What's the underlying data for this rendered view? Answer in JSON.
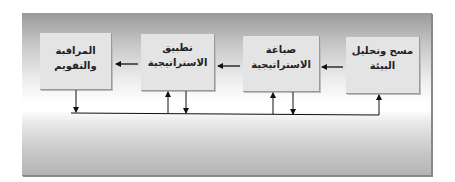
{
  "diagram": {
    "type": "flow",
    "direction": "right-to-left",
    "boxes": [
      {
        "id": "survey",
        "line1": "مسح وتحليل",
        "line2": "البيئة"
      },
      {
        "id": "formulation",
        "line1": "صياغة",
        "line2": "الاستراتيجية"
      },
      {
        "id": "implementation",
        "line1": "تطبيق",
        "line2": "الاستراتيجية"
      },
      {
        "id": "monitoring",
        "line1": "المراقبة والتقويم",
        "line2": ""
      }
    ],
    "edges": [
      {
        "from": "survey",
        "to": "formulation"
      },
      {
        "from": "formulation",
        "to": "implementation"
      },
      {
        "from": "implementation",
        "to": "monitoring"
      }
    ],
    "feedback": {
      "description": "Monitoring feeds a common feedback line that returns to all previous stages",
      "down_from": [
        "monitoring",
        "implementation",
        "formulation"
      ],
      "up_to": [
        "implementation",
        "formulation",
        "survey"
      ]
    }
  }
}
